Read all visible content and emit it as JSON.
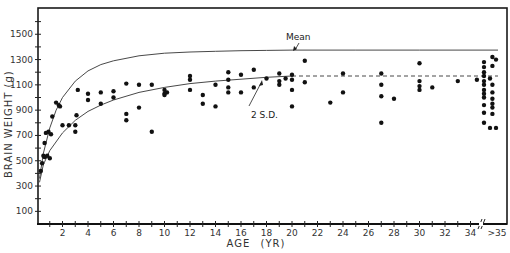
{
  "chart_data": {
    "type": "scatter",
    "title": "",
    "xlabel": "AGE (YR)",
    "ylabel": "BRAIN WEIGHT (g)",
    "xlim": [
      0,
      37
    ],
    "ylim": [
      0,
      1700
    ],
    "x_ticks": [
      2,
      4,
      6,
      8,
      10,
      12,
      14,
      16,
      18,
      20,
      22,
      24,
      26,
      28,
      30,
      32,
      34
    ],
    "x_tick_labels": [
      "2",
      "4",
      "6",
      "8",
      "10",
      "12",
      "14",
      "16",
      "18",
      "20",
      "22",
      "24",
      "26",
      "28",
      "30",
      "32",
      "34"
    ],
    "x_break_label": ">35",
    "y_ticks": [
      100,
      300,
      500,
      700,
      900,
      1100,
      1300,
      1500
    ],
    "y_tick_labels": [
      "100",
      "300",
      "500",
      "700",
      "900",
      "1100",
      "1300",
      "1500"
    ],
    "grid": false,
    "annotations": [
      {
        "text": "Mean",
        "x": 20,
        "y": 1380
      },
      {
        "text": "2 S.D.",
        "x": 17,
        "y": 1010
      }
    ],
    "series": [
      {
        "name": "Mean",
        "kind": "line",
        "x": [
          0.2,
          0.5,
          1,
          1.5,
          2,
          3,
          4,
          5,
          6,
          8,
          10,
          12,
          14,
          16,
          18,
          20,
          25,
          30,
          36
        ],
        "y": [
          360,
          560,
          760,
          900,
          1000,
          1130,
          1210,
          1260,
          1290,
          1330,
          1350,
          1360,
          1365,
          1370,
          1372,
          1375,
          1375,
          1375,
          1375
        ]
      },
      {
        "name": "2 S.D.",
        "kind": "line",
        "x": [
          0.2,
          0.5,
          1,
          2,
          3,
          4,
          5,
          6,
          8,
          10,
          12,
          14,
          16,
          18,
          20
        ],
        "y": [
          330,
          470,
          580,
          720,
          820,
          890,
          940,
          980,
          1040,
          1080,
          1110,
          1130,
          1145,
          1160,
          1170
        ]
      },
      {
        "name": "2 S.D. (extrapolated)",
        "kind": "dashed",
        "x": [
          20,
          36
        ],
        "y": [
          1170,
          1170
        ]
      },
      {
        "name": "Observations",
        "kind": "points",
        "x": [
          0.3,
          0.4,
          0.5,
          0.6,
          0.6,
          0.7,
          0.8,
          0.9,
          1.0,
          1.1,
          1.2,
          1.5,
          1.7,
          1.8,
          2.0,
          2.5,
          3.0,
          3.0,
          3.1,
          3.2,
          4.0,
          4.0,
          5.0,
          5.0,
          6.0,
          6.0,
          7.0,
          7.0,
          7.0,
          8.0,
          8.0,
          9.0,
          9.0,
          10.0,
          10.0,
          10.0,
          10.2,
          12.0,
          12.0,
          12.0,
          13.0,
          13.0,
          14.0,
          14.0,
          15.0,
          15.0,
          15.0,
          15.0,
          16.0,
          16.0,
          17.0,
          17.0,
          18.0,
          19.0,
          19.0,
          19.0,
          19.5,
          20.0,
          20.0,
          20.0,
          20.0,
          21.0,
          21.0,
          23.0,
          24.0,
          24.0,
          27.0,
          27.0,
          27.0,
          27.0,
          28.0,
          30.0,
          30.0,
          30.0,
          30.0,
          31.0,
          33.0,
          34.5,
          35.0,
          35.0,
          35.0,
          35.0,
          35.0,
          35.0,
          35.0,
          35.0,
          35.0,
          35.0,
          35.0,
          35.0,
          35.5,
          35.5,
          35.7,
          35.7,
          35.7,
          35.7,
          35.7,
          35.7,
          35.7,
          35.7,
          36.0,
          36.0
        ],
        "y": [
          420,
          480,
          540,
          530,
          640,
          720,
          540,
          730,
          520,
          710,
          850,
          960,
          940,
          930,
          780,
          780,
          780,
          730,
          860,
          1060,
          980,
          1030,
          950,
          1040,
          1000,
          1050,
          870,
          820,
          1110,
          920,
          1100,
          730,
          1100,
          1060,
          1030,
          1020,
          1040,
          1140,
          1170,
          1060,
          950,
          1020,
          930,
          1100,
          1200,
          1140,
          1080,
          1040,
          1180,
          1040,
          1220,
          1080,
          1150,
          1190,
          1130,
          1100,
          1150,
          1180,
          1140,
          1060,
          930,
          1290,
          1120,
          960,
          1190,
          1040,
          1190,
          1100,
          1010,
          800,
          990,
          1270,
          1130,
          1060,
          1090,
          1080,
          1130,
          1140,
          1280,
          1240,
          1200,
          1170,
          1130,
          1100,
          1060,
          1030,
          1000,
          940,
          880,
          800,
          760,
          1150,
          1320,
          1250,
          1100,
          1040,
          990,
          950,
          920,
          870,
          760,
          1300
        ]
      }
    ]
  }
}
